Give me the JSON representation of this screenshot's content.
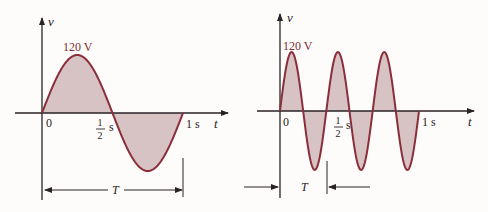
{
  "colors": {
    "curve": "#8b2e3b",
    "fill": "#d8c3c4",
    "axis": "#2a2226",
    "background": "#fdfcfa"
  },
  "left_plot": {
    "y_axis_label": "v",
    "x_axis_label": "t",
    "peak_label": "120 V",
    "origin_label": "0",
    "half_label_num": "1",
    "half_label_den": "2",
    "half_label_unit": "s",
    "end_label": "1 s",
    "period_label": "T",
    "cycles": 1
  },
  "right_plot": {
    "y_axis_label": "v",
    "x_axis_label": "t",
    "peak_label": "120 V",
    "origin_label": "0",
    "half_label_num": "1",
    "half_label_den": "2",
    "half_label_unit": "s",
    "end_label": "1 s",
    "period_label": "T",
    "cycles": 3
  }
}
